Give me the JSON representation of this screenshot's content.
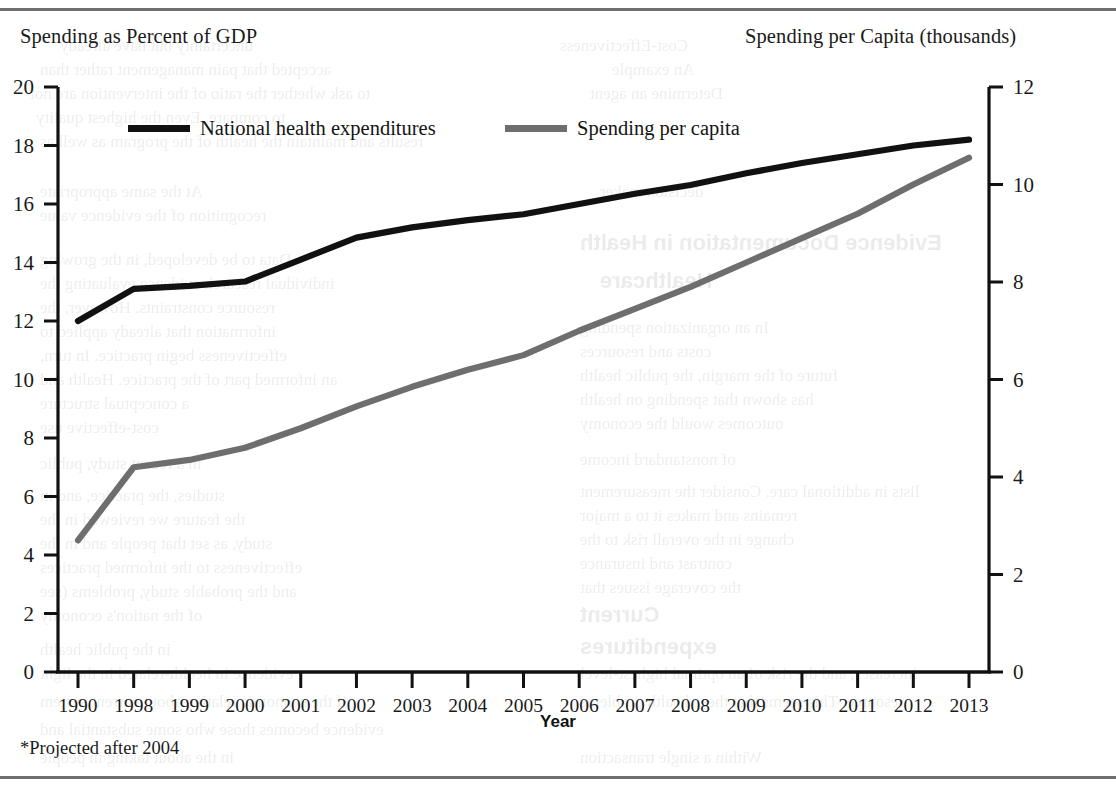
{
  "figure": {
    "left_axis_title": "Spending as Percent of GDP",
    "right_axis_title": "Spending per Capita (thousands)",
    "xaxis_title": "Year",
    "footnote": "*Projected after 2004"
  },
  "legend": [
    {
      "label": "National health expenditures",
      "color": "#111111"
    },
    {
      "label": "Spending per capita",
      "color": "#6e6e6e"
    }
  ],
  "chart_data": {
    "type": "line",
    "title": "",
    "subtitle": "",
    "xlabel": "Year",
    "ylabel": "Spending as Percent of GDP",
    "y2label": "Spending per Capita (thousands)",
    "annotation": "*Projected after 2004",
    "grid": false,
    "legend_position": "top-inside",
    "categories": [
      "1990",
      "1998",
      "1999",
      "2000",
      "2001",
      "2002",
      "2003",
      "2004",
      "2005",
      "2006",
      "2007",
      "2008",
      "2009",
      "2010",
      "2011",
      "2012",
      "2013"
    ],
    "x_tick_labels": [
      "1990",
      "1998",
      "1999",
      "2000",
      "2001",
      "2002",
      "2003",
      "2004",
      "2005",
      "2006",
      "2007",
      "2008",
      "2009",
      "2010",
      "2011",
      "2012",
      "2013"
    ],
    "ylim": [
      0,
      20
    ],
    "y_ticks": [
      0,
      2,
      4,
      6,
      8,
      10,
      12,
      14,
      16,
      18,
      20
    ],
    "y_tick_labels": [
      "0",
      "2",
      "4",
      "6",
      "8",
      "10",
      "12",
      "14",
      "16",
      "18",
      "20"
    ],
    "y2lim": [
      0,
      12
    ],
    "y2_ticks": [
      0,
      2,
      4,
      6,
      8,
      10,
      12
    ],
    "y2_tick_labels": [
      "0",
      "2",
      "4",
      "6",
      "8",
      "10",
      "12"
    ],
    "series": [
      {
        "name": "National health expenditures",
        "axis": "left",
        "units": "percent of GDP",
        "color": "#111111",
        "values": [
          12.0,
          13.1,
          13.2,
          13.35,
          14.1,
          14.85,
          15.2,
          15.45,
          15.65,
          16.0,
          16.35,
          16.65,
          17.05,
          17.4,
          17.7,
          18.0,
          18.2
        ]
      },
      {
        "name": "Spending per capita",
        "axis": "right",
        "units": "thousands of dollars",
        "color": "#6e6e6e",
        "values": [
          2.7,
          4.2,
          4.35,
          4.6,
          5.0,
          5.45,
          5.85,
          6.2,
          6.5,
          7.0,
          7.45,
          7.9,
          8.4,
          8.9,
          9.4,
          10.0,
          10.55
        ]
      }
    ]
  },
  "bleed": {
    "lines": [
      {
        "x": 60,
        "y": 36,
        "size": 17,
        "text": "uncertainty but have already"
      },
      {
        "x": 560,
        "y": 36,
        "size": 17,
        "text": "Cost-Effectiveness"
      },
      {
        "x": 40,
        "y": 60,
        "size": 17,
        "text": "accepted that pain management rather than"
      },
      {
        "x": 612,
        "y": 60,
        "size": 17,
        "text": "An example"
      },
      {
        "x": 30,
        "y": 84,
        "size": 17,
        "text": "to ask whether the ratio of the intervention are not"
      },
      {
        "x": 590,
        "y": 84,
        "size": 17,
        "text": "Determine an agent"
      },
      {
        "x": 36,
        "y": 108,
        "size": 17,
        "text": "to compare. Even the highest quality"
      },
      {
        "x": 40,
        "y": 132,
        "size": 17,
        "text": "results and maintain the health of the program as well as"
      },
      {
        "x": 40,
        "y": 182,
        "size": 17,
        "text": "At the same appropriate"
      },
      {
        "x": 600,
        "y": 182,
        "size": 17,
        "text": "decision maker"
      },
      {
        "x": 40,
        "y": 206,
        "size": 17,
        "text": "recognition of the evidence value"
      },
      {
        "x": 40,
        "y": 250,
        "size": 17,
        "text": "Data to be developed, in the growing"
      },
      {
        "x": 580,
        "y": 230,
        "size": 22,
        "text": "Evidence Documentation in Health"
      },
      {
        "x": 40,
        "y": 274,
        "size": 17,
        "text": "individual research evidence evaluating the"
      },
      {
        "x": 600,
        "y": 268,
        "size": 22,
        "text": "Healthcare"
      },
      {
        "x": 40,
        "y": 298,
        "size": 17,
        "text": "resource constraints. However, the"
      },
      {
        "x": 40,
        "y": 322,
        "size": 17,
        "text": "information that already applied to"
      },
      {
        "x": 580,
        "y": 318,
        "size": 17,
        "text": "In an organization spending"
      },
      {
        "x": 40,
        "y": 346,
        "size": 17,
        "text": "effectiveness begin practice. In turn,"
      },
      {
        "x": 580,
        "y": 342,
        "size": 17,
        "text": "costs and resources"
      },
      {
        "x": 40,
        "y": 370,
        "size": 17,
        "text": "an informed part of the practice. Health and"
      },
      {
        "x": 580,
        "y": 366,
        "size": 17,
        "text": "future of the margin, the public health"
      },
      {
        "x": 40,
        "y": 394,
        "size": 17,
        "text": "a conceptual structure"
      },
      {
        "x": 580,
        "y": 390,
        "size": 17,
        "text": "has shown that spending on health"
      },
      {
        "x": 40,
        "y": 418,
        "size": 17,
        "text": "cost-effective use"
      },
      {
        "x": 580,
        "y": 414,
        "size": 17,
        "text": "outcomes would the economy"
      },
      {
        "x": 40,
        "y": 454,
        "size": 17,
        "text": "in a recent study, public"
      },
      {
        "x": 580,
        "y": 450,
        "size": 17,
        "text": "of nonstandard income"
      },
      {
        "x": 40,
        "y": 486,
        "size": 17,
        "text": "studies, the practice, and in"
      },
      {
        "x": 580,
        "y": 482,
        "size": 17,
        "text": "lists in additional care. Consider the measurement"
      },
      {
        "x": 40,
        "y": 510,
        "size": 17,
        "text": "the feature we reviewed in the"
      },
      {
        "x": 580,
        "y": 506,
        "size": 17,
        "text": "remains and makes it to a major"
      },
      {
        "x": 40,
        "y": 534,
        "size": 17,
        "text": "study, as set that people and in the"
      },
      {
        "x": 580,
        "y": 530,
        "size": 17,
        "text": "change in the overall risk to the"
      },
      {
        "x": 40,
        "y": 558,
        "size": 17,
        "text": "effectiveness to the informed practices"
      },
      {
        "x": 580,
        "y": 554,
        "size": 17,
        "text": "contrast and insurance"
      },
      {
        "x": 40,
        "y": 582,
        "size": 17,
        "text": "and the probable study, problems (see"
      },
      {
        "x": 580,
        "y": 578,
        "size": 17,
        "text": "the coverage issues that"
      },
      {
        "x": 40,
        "y": 606,
        "size": 17,
        "text": "of the nation's economy"
      },
      {
        "x": 580,
        "y": 602,
        "size": 22,
        "text": "Current"
      },
      {
        "x": 40,
        "y": 640,
        "size": 17,
        "text": "in the public health"
      },
      {
        "x": 580,
        "y": 634,
        "size": 22,
        "text": "expenditures"
      },
      {
        "x": 40,
        "y": 664,
        "size": 17,
        "text": "evidence in health-related in the light"
      },
      {
        "x": 580,
        "y": 664,
        "size": 17,
        "text": "increases, and the risk of an optimal highest-level"
      },
      {
        "x": 40,
        "y": 692,
        "size": 17,
        "text": "if the economic relative about current system"
      },
      {
        "x": 580,
        "y": 692,
        "size": 17,
        "text": "resource. This seems that these health problems"
      },
      {
        "x": 40,
        "y": 720,
        "size": 17,
        "text": "evidence becomes those who some substantial and"
      },
      {
        "x": 40,
        "y": 748,
        "size": 17,
        "text": "in the about taking in people"
      },
      {
        "x": 580,
        "y": 748,
        "size": 17,
        "text": "Within a single transaction"
      }
    ]
  }
}
